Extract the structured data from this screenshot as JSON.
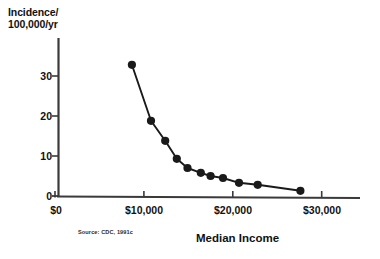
{
  "chart_data": {
    "type": "line",
    "title": "",
    "ylabel": "Incidence/\n100,000/yr",
    "xlabel": "Median Income",
    "source": "Source: CDC, 1991c",
    "xlim": [
      0,
      33000
    ],
    "ylim": [
      0,
      36
    ],
    "grid": false,
    "legend": "none",
    "marker": "filled-circle",
    "xticks": [
      {
        "value": 0,
        "label": "$0"
      },
      {
        "value": 10000,
        "label": "$10,000"
      },
      {
        "value": 20000,
        "label": "$20,000"
      },
      {
        "value": 30000,
        "label": "$30,000"
      }
    ],
    "yticks": [
      {
        "value": 0,
        "label": "0"
      },
      {
        "value": 10,
        "label": "10"
      },
      {
        "value": 20,
        "label": "20"
      },
      {
        "value": 30,
        "label": "30"
      }
    ],
    "series": [
      {
        "name": "Incidence vs Median Income",
        "x": [
          8650,
          10800,
          12400,
          13700,
          14900,
          16400,
          17500,
          18900,
          20700,
          22800,
          27600
        ],
        "y": [
          32.8,
          18.8,
          13.8,
          9.3,
          7.0,
          5.8,
          5.0,
          4.5,
          3.3,
          2.8,
          1.3
        ]
      }
    ]
  },
  "colors": {
    "line": "#1a1a1a",
    "marker": "#1a1a1a",
    "axis": "#3a3a3a",
    "text": "#111111"
  }
}
